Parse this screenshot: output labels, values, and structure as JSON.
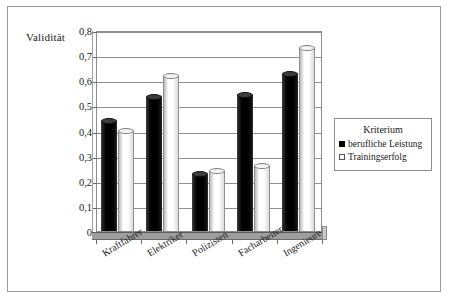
{
  "chart_data": {
    "type": "bar",
    "title": "",
    "xlabel": "",
    "ylabel": "Validität",
    "ylim": [
      0,
      0.8
    ],
    "ytick_labels": [
      "0",
      "0,1",
      "0,2",
      "0,3",
      "0,4",
      "0,5",
      "0,6",
      "0,7",
      "0,8"
    ],
    "ytick_values": [
      0,
      0.1,
      0.2,
      0.3,
      0.4,
      0.5,
      0.6,
      0.7,
      0.8
    ],
    "grid": true,
    "legend_position": "right",
    "categories": [
      "Kraftfahrer",
      "Elektriker",
      "Polizisten",
      "Facharbeiter",
      "Ingenieure"
    ],
    "series": [
      {
        "name": "berufliche Leistung",
        "color": "#000000",
        "values": [
          0.45,
          0.545,
          0.24,
          0.555,
          0.635
        ]
      },
      {
        "name": "Trainingserfolg",
        "color": "#ffffff",
        "values": [
          0.41,
          0.63,
          0.25,
          0.27,
          0.74
        ]
      }
    ]
  },
  "legend": {
    "title": "Kriterium",
    "entries": [
      {
        "label": "berufliche Leistung",
        "swatch": "dark"
      },
      {
        "label": "Trainingserfolg",
        "swatch": "light"
      }
    ]
  },
  "axis": {
    "y_title": "Validität"
  }
}
